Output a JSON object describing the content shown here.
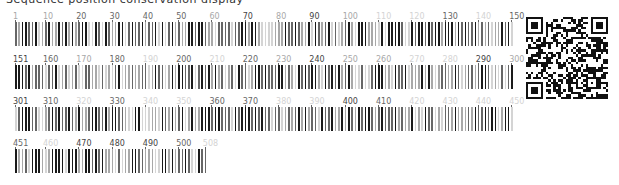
{
  "header": {
    "clipped_text": "Sequence position conservation display"
  },
  "sequence": {
    "length": 508,
    "per_row": 150,
    "rows": [
      {
        "start": 1,
        "end": 150,
        "labels": [
          {
            "pos": 1,
            "text": "1",
            "shade": "light"
          },
          {
            "pos": 10,
            "text": "10",
            "shade": "light"
          },
          {
            "pos": 20,
            "text": "20",
            "shade": "mid"
          },
          {
            "pos": 30,
            "text": "30",
            "shade": "mid"
          },
          {
            "pos": 40,
            "text": "40",
            "shade": "mid"
          },
          {
            "pos": 50,
            "text": "50",
            "shade": "mid"
          },
          {
            "pos": 60,
            "text": "60",
            "shade": "light"
          },
          {
            "pos": 70,
            "text": "70",
            "shade": "dark"
          },
          {
            "pos": 80,
            "text": "80",
            "shade": "light"
          },
          {
            "pos": 90,
            "text": "90",
            "shade": "dark"
          },
          {
            "pos": 100,
            "text": "100",
            "shade": "light"
          },
          {
            "pos": 110,
            "text": "110",
            "shade": "faint"
          },
          {
            "pos": 120,
            "text": "120",
            "shade": "faint"
          },
          {
            "pos": 130,
            "text": "130",
            "shade": "mid"
          },
          {
            "pos": 140,
            "text": "140",
            "shade": "faint"
          },
          {
            "pos": 150,
            "text": "150",
            "shade": "mid"
          }
        ]
      },
      {
        "start": 151,
        "end": 300,
        "labels": [
          {
            "pos": 151,
            "text": "151",
            "shade": "dark"
          },
          {
            "pos": 160,
            "text": "160",
            "shade": "mid"
          },
          {
            "pos": 170,
            "text": "170",
            "shade": "light"
          },
          {
            "pos": 180,
            "text": "180",
            "shade": "mid"
          },
          {
            "pos": 190,
            "text": "190",
            "shade": "faint"
          },
          {
            "pos": 200,
            "text": "200",
            "shade": "mid"
          },
          {
            "pos": 210,
            "text": "210",
            "shade": "faint"
          },
          {
            "pos": 220,
            "text": "220",
            "shade": "mid"
          },
          {
            "pos": 230,
            "text": "230",
            "shade": "light"
          },
          {
            "pos": 240,
            "text": "240",
            "shade": "dark"
          },
          {
            "pos": 250,
            "text": "250",
            "shade": "light"
          },
          {
            "pos": 260,
            "text": "260",
            "shade": "light"
          },
          {
            "pos": 270,
            "text": "270",
            "shade": "faint"
          },
          {
            "pos": 280,
            "text": "280",
            "shade": "faint"
          },
          {
            "pos": 290,
            "text": "290",
            "shade": "dark"
          },
          {
            "pos": 300,
            "text": "300",
            "shade": "light"
          }
        ]
      },
      {
        "start": 301,
        "end": 450,
        "labels": [
          {
            "pos": 301,
            "text": "301",
            "shade": "dark"
          },
          {
            "pos": 310,
            "text": "310",
            "shade": "mid"
          },
          {
            "pos": 320,
            "text": "320",
            "shade": "faint"
          },
          {
            "pos": 330,
            "text": "330",
            "shade": "mid"
          },
          {
            "pos": 340,
            "text": "340",
            "shade": "faint"
          },
          {
            "pos": 350,
            "text": "350",
            "shade": "faint"
          },
          {
            "pos": 360,
            "text": "360",
            "shade": "mid"
          },
          {
            "pos": 370,
            "text": "370",
            "shade": "mid"
          },
          {
            "pos": 380,
            "text": "380",
            "shade": "faint"
          },
          {
            "pos": 390,
            "text": "390",
            "shade": "faint"
          },
          {
            "pos": 400,
            "text": "400",
            "shade": "dark"
          },
          {
            "pos": 410,
            "text": "410",
            "shade": "mid"
          },
          {
            "pos": 420,
            "text": "420",
            "shade": "faint"
          },
          {
            "pos": 430,
            "text": "430",
            "shade": "faint"
          },
          {
            "pos": 440,
            "text": "440",
            "shade": "faint"
          },
          {
            "pos": 450,
            "text": "450",
            "shade": "faint"
          }
        ]
      },
      {
        "start": 451,
        "end": 508,
        "labels": [
          {
            "pos": 451,
            "text": "451",
            "shade": "mid"
          },
          {
            "pos": 460,
            "text": "460",
            "shade": "faint"
          },
          {
            "pos": 470,
            "text": "470",
            "shade": "dark"
          },
          {
            "pos": 480,
            "text": "480",
            "shade": "dark"
          },
          {
            "pos": 490,
            "text": "490",
            "shade": "dark"
          },
          {
            "pos": 500,
            "text": "500",
            "shade": "mid"
          },
          {
            "pos": 508,
            "text": "508",
            "shade": "faint"
          }
        ]
      }
    ]
  },
  "colors": {
    "dark": "#1a1a1a",
    "mid": "#666666",
    "light": "#a8a8a8",
    "faint": "#d4d4d4",
    "background": "#ffffff"
  },
  "qr_code": {
    "label": "QR code"
  }
}
